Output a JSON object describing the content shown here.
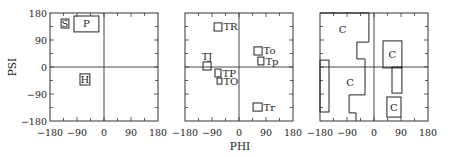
{
  "figure": {
    "xlabel": "PHI",
    "ylabel": "PSI",
    "x_ticks": [
      "−180",
      "−90",
      "0",
      "90",
      "180"
    ],
    "y_ticks": [
      "180",
      "90",
      "0",
      "−90",
      "−180"
    ]
  },
  "chart_data": [
    {
      "type": "scatter",
      "title": "",
      "xlabel": "PHI",
      "ylabel": "PSI",
      "xlim": [
        -180,
        180
      ],
      "ylim": [
        -180,
        180
      ],
      "x_ticks": [
        -180,
        -90,
        0,
        90,
        180
      ],
      "y_ticks": [
        -180,
        -90,
        0,
        90,
        180
      ],
      "grid": false,
      "regions": [
        {
          "label": "S",
          "phi": [
            -143,
            -117
          ],
          "psi": [
            130,
            160
          ],
          "label_inside": true
        },
        {
          "label": "P",
          "phi": [
            -100,
            -17
          ],
          "psi": [
            117,
            170
          ],
          "label_inside": true
        },
        {
          "label": "H",
          "phi": [
            -80,
            -47
          ],
          "psi": [
            -60,
            -23
          ],
          "label_inside": true
        }
      ]
    },
    {
      "type": "scatter",
      "title": "",
      "xlabel": "PHI",
      "ylabel": "",
      "xlim": [
        -180,
        180
      ],
      "ylim": [
        -180,
        180
      ],
      "x_ticks": [
        -180,
        -90,
        0,
        90,
        180
      ],
      "y_ticks": [
        -180,
        -90,
        0,
        90,
        180
      ],
      "grid": false,
      "regions": [
        {
          "label": "TR",
          "phi": [
            -83,
            -57
          ],
          "psi": [
            120,
            147
          ],
          "label_pos": "right"
        },
        {
          "label": "To",
          "phi": [
            50,
            77
          ],
          "psi": [
            40,
            67
          ],
          "label_pos": "right"
        },
        {
          "label": "Tp",
          "phi": [
            63,
            83
          ],
          "psi": [
            7,
            33
          ],
          "label_pos": "right"
        },
        {
          "label": "TJ",
          "phi": [
            -120,
            -93
          ],
          "psi": [
            -10,
            17
          ],
          "label_pos": "above"
        },
        {
          "label": "TP",
          "phi": [
            -80,
            -60
          ],
          "psi": [
            -33,
            -7
          ],
          "label_pos": "right"
        },
        {
          "label": "TO",
          "phi": [
            -73,
            -57
          ],
          "psi": [
            -57,
            -37
          ],
          "label_pos": "right"
        },
        {
          "label": "Tr",
          "phi": [
            47,
            77
          ],
          "psi": [
            -147,
            -120
          ],
          "label_pos": "right"
        }
      ]
    },
    {
      "type": "scatter",
      "title": "",
      "xlabel": "",
      "ylabel": "",
      "xlim": [
        -180,
        180
      ],
      "ylim": [
        -180,
        180
      ],
      "x_ticks": [
        -180,
        -90,
        0,
        90,
        180
      ],
      "y_ticks": [
        -180,
        -90,
        0,
        90,
        180
      ],
      "grid": false,
      "polygons": [
        {
          "label": "C",
          "points": [
            [
              -180,
              180
            ],
            [
              -17,
              180
            ],
            [
              -17,
              83
            ],
            [
              -57,
              83
            ],
            [
              -57,
              27
            ],
            [
              -30,
              27
            ],
            [
              -30,
              -93
            ],
            [
              -83,
              -93
            ],
            [
              -83,
              -153
            ],
            [
              -60,
              -153
            ],
            [
              -60,
              -180
            ]
          ],
          "open": true,
          "label_at": [
            -105,
            125
          ]
        },
        {
          "label": "C",
          "points": [],
          "label_at": [
            -80,
            -50
          ]
        }
      ],
      "regions": [
        {
          "label": "",
          "phi": [
            -180,
            -150
          ],
          "psi": [
            -150,
            23
          ]
        },
        {
          "label": "C",
          "phi": [
            30,
            93
          ],
          "psi": [
            -3,
            87
          ],
          "label_inside": true
        },
        {
          "label": "",
          "phi": [
            60,
            93
          ],
          "psi": [
            -87,
            0
          ]
        },
        {
          "label": "C",
          "phi": [
            43,
            90
          ],
          "psi": [
            -167,
            -100
          ],
          "label_inside": true
        }
      ]
    }
  ]
}
